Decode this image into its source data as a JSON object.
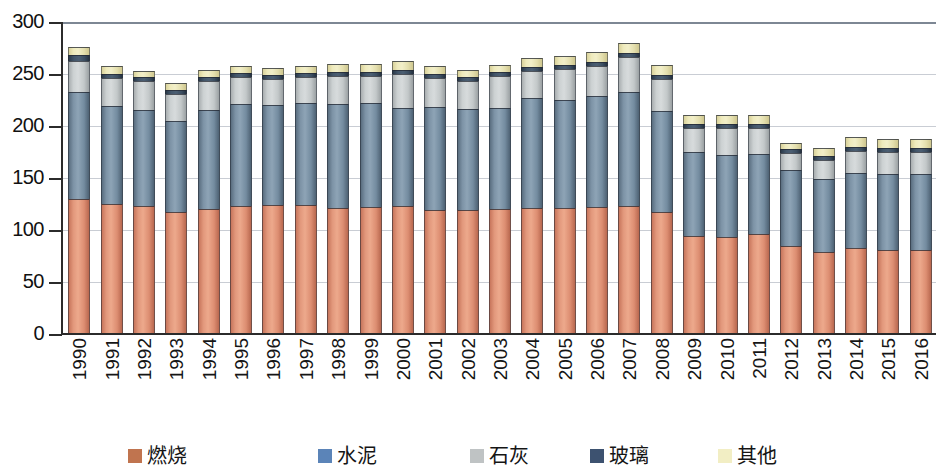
{
  "chart_data": {
    "type": "bar",
    "subtype": "stacked-column",
    "title": "",
    "xlabel": "",
    "ylabel": "",
    "ylim": [
      0,
      300
    ],
    "yticks": [
      0,
      50,
      100,
      150,
      200,
      250,
      300
    ],
    "ytick_labels": [
      "0",
      "50",
      "100",
      "150",
      "200",
      "250",
      "300"
    ],
    "grid": true,
    "legend_position": "bottom",
    "categories": [
      "1990",
      "1991",
      "1992",
      "1993",
      "1994",
      "1995",
      "1996",
      "1997",
      "1998",
      "1999",
      "2000",
      "2001",
      "2002",
      "2003",
      "2004",
      "2005",
      "2006",
      "2007",
      "2008",
      "2009",
      "2010",
      "2011",
      "2012",
      "2013",
      "2014",
      "2015",
      "2016"
    ],
    "series": [
      {
        "name": "燃烧",
        "key": "combustion",
        "color": "#d9845f",
        "values": [
          130,
          125,
          123,
          117,
          120,
          123,
          124,
          124,
          121,
          122,
          123,
          119,
          119,
          120,
          121,
          121,
          122,
          123,
          117,
          94,
          93,
          96,
          85,
          79,
          83,
          81,
          81
        ]
      },
      {
        "name": "水泥",
        "key": "cement",
        "color": "#7d93a6",
        "values": [
          103,
          94,
          92,
          88,
          95,
          98,
          96,
          98,
          100,
          100,
          94,
          99,
          97,
          97,
          106,
          104,
          107,
          110,
          97,
          81,
          79,
          77,
          73,
          70,
          72,
          73,
          73
        ]
      },
      {
        "name": "石灰",
        "key": "lime",
        "color": "#cbd0d1",
        "values": [
          30,
          27,
          28,
          26,
          28,
          26,
          25,
          25,
          27,
          26,
          33,
          28,
          27,
          31,
          26,
          30,
          29,
          33,
          31,
          23,
          26,
          25,
          16,
          18,
          21,
          21,
          21
        ]
      },
      {
        "name": "玻璃",
        "key": "glass",
        "color": "#3d4f63",
        "values": [
          5,
          4,
          4,
          4,
          4,
          4,
          4,
          4,
          4,
          4,
          4,
          4,
          4,
          4,
          4,
          4,
          4,
          4,
          4,
          4,
          4,
          4,
          4,
          4,
          4,
          4,
          4
        ]
      },
      {
        "name": "其他",
        "key": "other",
        "color": "#efeabe",
        "values": [
          8,
          8,
          6,
          6,
          7,
          7,
          7,
          7,
          8,
          8,
          9,
          8,
          7,
          7,
          8,
          8,
          9,
          10,
          10,
          9,
          9,
          9,
          6,
          8,
          9,
          9,
          9
        ]
      }
    ],
    "totals": [
      276,
      258,
      253,
      241,
      254,
      258,
      256,
      258,
      260,
      260,
      263,
      258,
      254,
      259,
      265,
      267,
      271,
      280,
      259,
      211,
      211,
      211,
      184,
      179,
      189,
      188,
      188
    ]
  },
  "legend": {
    "items": [
      {
        "label": "燃烧",
        "color": "#c0744f"
      },
      {
        "label": "水泥",
        "color": "#5b84b8"
      },
      {
        "label": "石灰",
        "color": "#bfc3c4"
      },
      {
        "label": "玻璃",
        "color": "#3d5270"
      },
      {
        "label": "其他",
        "color": "#f2eec4"
      }
    ]
  }
}
